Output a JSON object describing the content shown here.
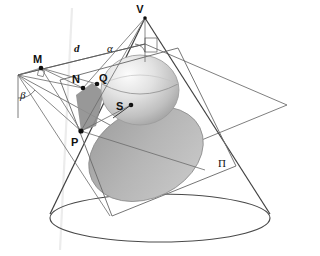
{
  "figure": {
    "background": "#ffffff",
    "stroke_color": "#3a3a3a",
    "thin_stroke": "#8a8a8a"
  },
  "labels": {
    "vertex": "V",
    "point_m": "M",
    "point_n": "N",
    "point_q": "Q",
    "point_p": "P",
    "sphere_center": "S",
    "plane": "Π",
    "directrix": "d",
    "angle_apex": "α",
    "angle_plane": "β"
  },
  "colors": {
    "cone_outline": "#3f3f3f",
    "plane_outline": "#6e6e6e",
    "ellipse_fill": "#b4b4b4",
    "ellipse_dark": "#9a9a9a",
    "sphere_light": "#f2f2f2",
    "sphere_mid": "#d2d2d2",
    "sphere_shadow": "#a8a8a8",
    "wedge_fill": "#8d8d8d",
    "marker": "#101010"
  },
  "geometry": {
    "apex": {
      "x": 145,
      "y": 18
    },
    "sphere": {
      "cx": 140,
      "cy": 90,
      "rx": 38,
      "ry": 34
    },
    "sphere_center_pt": {
      "x": 131,
      "y": 105
    },
    "cone_base": {
      "cx": 160,
      "cy": 218,
      "rx": 110,
      "ry": 24
    },
    "cut_ellipse": {
      "cx": 143,
      "cy": 152,
      "rx": 58,
      "ry": 43,
      "rot": -27
    },
    "point_m": {
      "x": 41,
      "y": 68
    },
    "point_n": {
      "x": 83,
      "y": 88
    },
    "point_q": {
      "x": 97,
      "y": 84
    },
    "point_p": {
      "x": 81,
      "y": 131
    },
    "plane_quad": [
      {
        "x": 18,
        "y": 75
      },
      {
        "x": 145,
        "y": 44
      },
      {
        "x": 287,
        "y": 105
      },
      {
        "x": 165,
        "y": 155
      }
    ],
    "cut_plane_quad": [
      {
        "x": 60,
        "y": 80
      },
      {
        "x": 175,
        "y": 48
      },
      {
        "x": 232,
        "y": 165
      },
      {
        "x": 110,
        "y": 215
      }
    ]
  },
  "elements": [
    {
      "name": "cone",
      "kind": "solid"
    },
    {
      "name": "dandelin-sphere",
      "kind": "solid"
    },
    {
      "name": "cutting-plane",
      "kind": "plane"
    },
    {
      "name": "horizontal-plane",
      "kind": "plane"
    },
    {
      "name": "conic-section-ellipse",
      "kind": "curve"
    }
  ]
}
